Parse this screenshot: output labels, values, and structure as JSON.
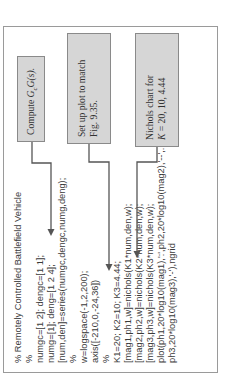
{
  "figure": {
    "code_lines": [
      "% Remotely Controlled Battlefield Vehicle",
      "%",
      "numgc=[1 2]; dengc=[1 1];",
      "numg=[1]; deng=[1 2 4];",
      "[num,den]=series(numgc,dengc,numg,deng);",
      "%",
      "w=logspace(-1,2,200);",
      "axis([-210,0,-24,36])",
      "%",
      "K1=20; K2=10; K3=4.44;",
      "[mag1,ph1,w]=nichols(K1*num,den,w);",
      "[mag2,ph2,w]=nichols(K2*num,den,w);",
      "[mag3,ph3,w]=nichols(K3*num,den,w);",
      "plot(ph1,20*log10(mag1),':',ph2,20*log10(mag2),'--',...",
      "ph3,20*log10(mag3),'-'),ngrid"
    ],
    "annotations": [
      {
        "line1": "Compute ",
        "math": "G_cG(s)",
        "math_main": "G",
        "math_sub": "c",
        "math_rest": "G(s).",
        "line2": ""
      },
      {
        "line1": "Set up plot to match",
        "line2": "Fig. 9.35."
      },
      {
        "line1": "Nichols chart for",
        "line2_k": "K",
        "line2": " = 20, 10, 4.44"
      }
    ],
    "colors": {
      "frame_border": "#9a9a9a",
      "box_fill": "#d6d6d6",
      "box_border": "#8a8a8a",
      "arrow": "#555555",
      "text": "#3a3a3a"
    },
    "orientation": "rotated -90 degrees"
  }
}
